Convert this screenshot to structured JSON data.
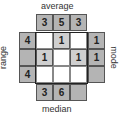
{
  "labels": {
    "top": "average",
    "bottom": "median",
    "left": "range",
    "right": "mode"
  },
  "top_row": [
    "3",
    "5",
    "3"
  ],
  "bottom_row": [
    "3",
    "6",
    ""
  ],
  "left_col": [
    "4",
    "",
    "4"
  ],
  "right_col": [
    "1",
    "1",
    ""
  ],
  "inner_grid": [
    [
      "",
      "1",
      ""
    ],
    [
      "1",
      "",
      "1"
    ],
    [
      "",
      "",
      ""
    ]
  ],
  "colors": {
    "outer_cell": "#b4b4b4",
    "inner_shaded": "#cfcfcf",
    "inner_blank": "#ffffff",
    "frame": "#222222"
  }
}
